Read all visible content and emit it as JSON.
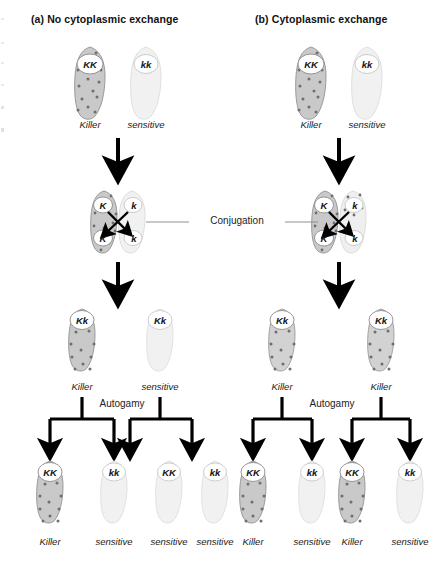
{
  "figure": {
    "type": "biology-diagram",
    "process_labels": {
      "conjugation": "Conjugation",
      "autogamy": "Autogamy"
    },
    "phenotypes": {
      "killer": "Killer",
      "sensitive": "sensitive"
    },
    "colors": {
      "killer_fill": "#c9c9c9",
      "killer_stroke": "#9a9a9a",
      "sensitive_fill": "#f1f1f1",
      "sensitive_stroke": "#dcdcdc",
      "kappa_dot": "#6e6e6e",
      "nucleus_fill": "#ffffff",
      "nucleus_stroke": "#8c8c8c",
      "arrow": "#000000",
      "line": "#8f8f8f"
    }
  },
  "panels": [
    {
      "id": "a",
      "title": "(a) No cytoplasmic exchange",
      "rows": {
        "parents": [
          {
            "genotype": "KK",
            "phenotype": "Killer",
            "killer": true
          },
          {
            "genotype": "kk",
            "phenotype": "sensitive",
            "killer": false
          }
        ],
        "conjugation": {
          "left": {
            "nuclei": [
              "K",
              "K"
            ],
            "killer": true
          },
          "right": {
            "nuclei": [
              "k",
              "k"
            ],
            "killer": false
          },
          "cytoplasmic_exchange": false
        },
        "exconjugants": [
          {
            "genotype": "Kk",
            "phenotype": "Killer",
            "killer": true
          },
          {
            "genotype": "Kk",
            "phenotype": "sensitive",
            "killer": false
          }
        ],
        "progeny": [
          {
            "genotype": "KK",
            "phenotype": "Killer",
            "killer": true
          },
          {
            "genotype": "kk",
            "phenotype": "sensitive",
            "killer": false
          },
          {
            "genotype": "KK",
            "phenotype": "sensitive",
            "killer": false
          },
          {
            "genotype": "kk",
            "phenotype": "sensitive",
            "killer": false
          }
        ]
      }
    },
    {
      "id": "b",
      "title": "(b) Cytoplasmic exchange",
      "rows": {
        "parents": [
          {
            "genotype": "KK",
            "phenotype": "Killer",
            "killer": true
          },
          {
            "genotype": "kk",
            "phenotype": "sensitive",
            "killer": false
          }
        ],
        "conjugation": {
          "left": {
            "nuclei": [
              "K",
              "K"
            ],
            "killer": true
          },
          "right": {
            "nuclei": [
              "k",
              "k"
            ],
            "killer": true
          },
          "cytoplasmic_exchange": true
        },
        "exconjugants": [
          {
            "genotype": "Kk",
            "phenotype": "Killer",
            "killer": true
          },
          {
            "genotype": "Kk",
            "phenotype": "Killer",
            "killer": true
          }
        ],
        "progeny": [
          {
            "genotype": "KK",
            "phenotype": "Killer",
            "killer": true
          },
          {
            "genotype": "kk",
            "phenotype": "sensitive",
            "killer": false
          },
          {
            "genotype": "KK",
            "phenotype": "Killer",
            "killer": true
          },
          {
            "genotype": "kk",
            "phenotype": "sensitive",
            "killer": false
          }
        ]
      }
    }
  ]
}
